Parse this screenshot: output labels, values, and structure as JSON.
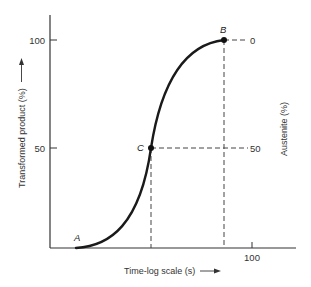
{
  "diagram": {
    "type": "transformation-curve",
    "y_axis_left": {
      "label": "Transformed product (%)",
      "ticks": [
        "100",
        "50"
      ]
    },
    "y_axis_right": {
      "label": "Austenite (%)",
      "ticks": [
        "0",
        "50"
      ]
    },
    "x_axis": {
      "label": "Time-log scale (s)",
      "ticks": [
        "100"
      ]
    },
    "points": [
      {
        "id": "A",
        "label": "A",
        "description": "start of transformation"
      },
      {
        "id": "C",
        "label": "C",
        "description": "50% transformed"
      },
      {
        "id": "B",
        "label": "B",
        "description": "100% transformed"
      }
    ],
    "colors": {
      "curve": "#1a1a1a",
      "axis": "#333333",
      "dashed": "#444444"
    }
  }
}
